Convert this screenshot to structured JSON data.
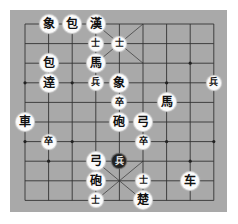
{
  "board": {
    "type": "xiangqi",
    "columns": 9,
    "rows": 10,
    "origin": {
      "x": 25,
      "y": 24
    },
    "col_spacing": 23.6,
    "row_spacing": 19.6,
    "colors": {
      "board": "#a9a9a9",
      "lines": "#333333",
      "piece_light": "#fbfbfb",
      "piece_dark": "#222222"
    },
    "markers": [
      [
        0,
        3
      ],
      [
        2,
        3
      ],
      [
        6,
        3
      ],
      [
        7,
        2
      ],
      [
        0,
        6
      ],
      [
        2,
        6
      ],
      [
        6,
        6
      ],
      [
        8,
        6
      ],
      [
        1,
        7
      ],
      [
        7,
        7
      ]
    ],
    "palaces": [
      {
        "cols": [
          3,
          5
        ],
        "rows": [
          0,
          2
        ]
      },
      {
        "cols": [
          3,
          5
        ],
        "rows": [
          7,
          9
        ]
      }
    ]
  },
  "pieces": [
    {
      "label": "象",
      "col": 1,
      "row": 0,
      "size": "large",
      "style": "light"
    },
    {
      "label": "包",
      "col": 2,
      "row": 0,
      "size": "large",
      "style": "light"
    },
    {
      "label": "漢",
      "col": 3,
      "row": 0,
      "size": "large",
      "style": "light"
    },
    {
      "label": "士",
      "col": 3,
      "row": 1,
      "size": "small",
      "style": "light"
    },
    {
      "label": "士",
      "col": 4,
      "row": 1,
      "size": "small",
      "style": "light"
    },
    {
      "label": "包",
      "col": 1,
      "row": 2,
      "size": "large",
      "style": "light"
    },
    {
      "label": "馬",
      "col": 3,
      "row": 2,
      "size": "large",
      "style": "light"
    },
    {
      "label": "逹",
      "col": 1,
      "row": 3,
      "size": "large",
      "style": "light"
    },
    {
      "label": "兵",
      "col": 3,
      "row": 3,
      "size": "small",
      "style": "light"
    },
    {
      "label": "象",
      "col": 4,
      "row": 3,
      "size": "large",
      "style": "light"
    },
    {
      "label": "兵",
      "col": 8,
      "row": 3,
      "size": "small",
      "style": "light"
    },
    {
      "label": "卒",
      "col": 4,
      "row": 4,
      "size": "small",
      "style": "light"
    },
    {
      "label": "馬",
      "col": 6,
      "row": 4,
      "size": "large",
      "style": "light"
    },
    {
      "label": "車",
      "col": 0,
      "row": 5,
      "size": "large",
      "style": "light"
    },
    {
      "label": "砲",
      "col": 4,
      "row": 5,
      "size": "large",
      "style": "light"
    },
    {
      "label": "弓",
      "col": 5,
      "row": 5,
      "size": "large",
      "style": "light"
    },
    {
      "label": "卒",
      "col": 1,
      "row": 6,
      "size": "small",
      "style": "light"
    },
    {
      "label": "卒",
      "col": 5,
      "row": 6,
      "size": "small",
      "style": "light"
    },
    {
      "label": "弓",
      "col": 3,
      "row": 7,
      "size": "large",
      "style": "light"
    },
    {
      "label": "兵",
      "col": 4,
      "row": 7,
      "size": "small",
      "style": "dark"
    },
    {
      "label": "砲",
      "col": 3,
      "row": 8,
      "size": "large",
      "style": "light"
    },
    {
      "label": "士",
      "col": 5,
      "row": 8,
      "size": "small",
      "style": "light"
    },
    {
      "label": "车",
      "col": 7,
      "row": 8,
      "size": "large",
      "style": "light"
    },
    {
      "label": "士",
      "col": 3,
      "row": 9,
      "size": "small",
      "style": "light"
    },
    {
      "label": "楚",
      "col": 5,
      "row": 9,
      "size": "large",
      "style": "light"
    }
  ]
}
